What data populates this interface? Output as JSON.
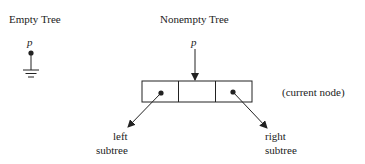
{
  "empty_tree": {
    "title": "Empty Tree",
    "pointer_label": "p"
  },
  "nonempty_tree": {
    "title": "Nonempty Tree",
    "pointer_label": "p",
    "node_annotation": "(current node)",
    "node_cells": [
      "left pointer",
      "data",
      "right pointer"
    ],
    "left_label_line1": "left",
    "left_label_line2": "subtree",
    "right_label_line1": "right",
    "right_label_line2": "subtree"
  }
}
